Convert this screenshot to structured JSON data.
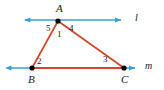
{
  "figure": {
    "type": "geometry-diagram",
    "width": 164,
    "height": 90,
    "background": "#ffffff",
    "colors": {
      "triangle": "#d1452a",
      "lines": "#3a9fd8",
      "points": "#000000",
      "text": "#1a1a1a"
    }
  },
  "points": [
    {
      "name": "A",
      "label": "A",
      "x": 58,
      "y": 21,
      "label_x": 56,
      "label_y": 3
    },
    {
      "name": "B",
      "label": "B",
      "x": 32,
      "y": 68,
      "label_x": 28,
      "label_y": 74
    },
    {
      "name": "C",
      "label": "C",
      "x": 124,
      "y": 68,
      "label_x": 121,
      "label_y": 74
    }
  ],
  "lines": [
    {
      "name": "l",
      "label": "l",
      "label_x": 135,
      "label_y": 13,
      "y": 20,
      "x_start": 24,
      "x_end": 127,
      "passes_through": "A",
      "arrows": "both"
    },
    {
      "name": "m",
      "label": "m",
      "label_x": 145,
      "label_y": 61,
      "y": 68,
      "x_start": 5,
      "x_end": 140,
      "passes_through": "B, C",
      "arrows": "both"
    }
  ],
  "triangle": {
    "name": "triangle-ABC",
    "vertices": [
      "A",
      "B",
      "C"
    ],
    "sides": [
      "AB",
      "AC",
      "BC"
    ]
  },
  "angles": [
    {
      "number": "5",
      "at": "A",
      "x": 46,
      "y": 24,
      "description": "angle between ray A-left along line l and side AB"
    },
    {
      "number": "1",
      "at": "A",
      "x": 57,
      "y": 30,
      "description": "interior angle BAC"
    },
    {
      "number": "4",
      "at": "A",
      "x": 69,
      "y": 24,
      "description": "angle between side AC and ray A-right along line l"
    },
    {
      "number": "2",
      "at": "B",
      "x": 37,
      "y": 57,
      "description": "interior angle ABC"
    },
    {
      "number": "3",
      "at": "C",
      "x": 103,
      "y": 55,
      "description": "interior angle ACB"
    }
  ]
}
